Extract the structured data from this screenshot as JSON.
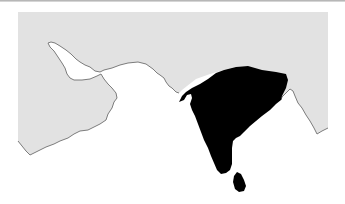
{
  "map": {
    "type": "locator-map",
    "region": "South Asia",
    "highlighted_region": "Indian subcontinent",
    "colors": {
      "background_sea": "#ffffff",
      "land": "#e2e2e2",
      "coastline": "#6e6e6e",
      "highlight": "#000000",
      "top_rule": "#a8a8a8"
    }
  }
}
